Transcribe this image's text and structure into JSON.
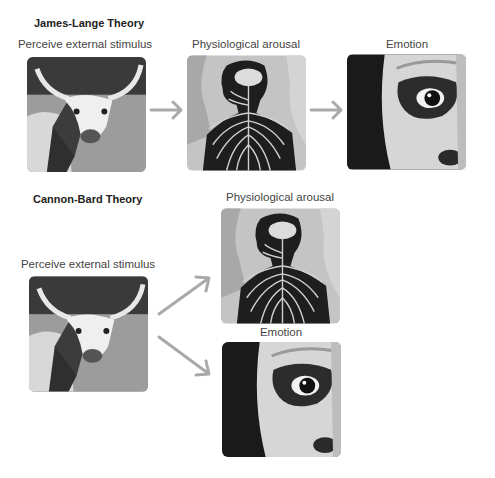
{
  "diagram": {
    "james_lange": {
      "title": "James-Lange Theory",
      "steps": [
        {
          "label": "Perceive external stimulus",
          "image": "longhorn-cow-photo"
        },
        {
          "label": "Physiological arousal",
          "image": "nervous-system-illustration"
        },
        {
          "label": "Emotion",
          "image": "frightened-face-closeup"
        }
      ],
      "connectors": [
        "arrow-right",
        "arrow-right"
      ]
    },
    "cannon_bard": {
      "title": "Cannon-Bard Theory",
      "steps": [
        {
          "label": "Perceive external stimulus",
          "image": "longhorn-cow-photo"
        },
        {
          "label": "Physiological arousal",
          "image": "nervous-system-illustration"
        },
        {
          "label": "Emotion",
          "image": "frightened-face-closeup"
        }
      ],
      "connectors": [
        "arrow-up-right",
        "arrow-down-right"
      ]
    },
    "colors": {
      "arrow": "#a9a9a9",
      "heading_text": "#222222",
      "caption_text": "#444444",
      "background": "#ffffff"
    }
  }
}
